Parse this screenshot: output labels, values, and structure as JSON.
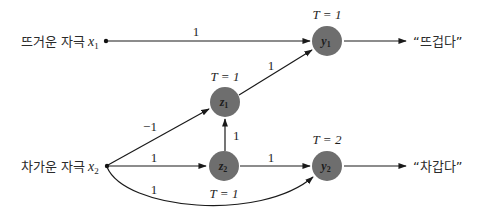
{
  "diagram": {
    "type": "neural-network",
    "colors": {
      "node": "#6e6e6e",
      "edge": "#1a1a1a",
      "text": "#1e1e1e"
    },
    "inputs": {
      "x1": {
        "label": "뜨거운 자극",
        "symbol": "x",
        "subscript": "1"
      },
      "x2": {
        "label": "차가운 자극",
        "symbol": "x",
        "subscript": "2"
      }
    },
    "nodes": {
      "y1": {
        "symbol": "y",
        "subscript": "1",
        "threshold": "T = 1"
      },
      "y2": {
        "symbol": "y",
        "subscript": "2",
        "threshold": "T = 2"
      },
      "z1": {
        "symbol": "z",
        "subscript": "1",
        "threshold": "T = 1"
      },
      "z2": {
        "symbol": "z",
        "subscript": "2",
        "threshold": "T = 1"
      }
    },
    "outputs": {
      "y1": "“뜨겁다”",
      "y2": "“차갑다”"
    },
    "edges": [
      {
        "from": "x1",
        "to": "y1",
        "weight": "1"
      },
      {
        "from": "x2",
        "to": "z1",
        "weight": "−1"
      },
      {
        "from": "x2",
        "to": "z2",
        "weight": "1"
      },
      {
        "from": "x2",
        "to": "y2",
        "weight": "1",
        "curved": true
      },
      {
        "from": "z2",
        "to": "z1",
        "weight": "1"
      },
      {
        "from": "z1",
        "to": "y1",
        "weight": "1"
      },
      {
        "from": "z2",
        "to": "y2",
        "weight": "1"
      }
    ]
  }
}
